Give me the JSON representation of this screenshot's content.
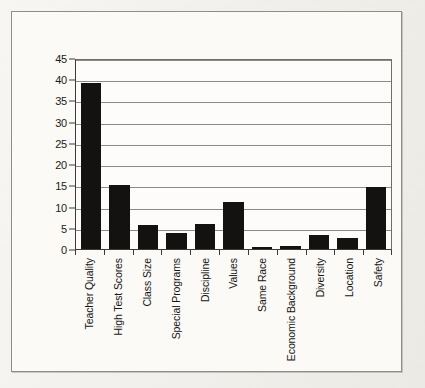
{
  "chart_data": {
    "type": "bar",
    "title": "",
    "xlabel": "",
    "ylabel": "% Mentioning Item",
    "ylim": [
      0,
      45
    ],
    "ytick_step": 5,
    "grid": true,
    "legend": "none",
    "orientation": "vertical",
    "bar_color": "#131211",
    "categories": [
      "Teacher Quality",
      "High Test Scores",
      "Class Size",
      "Special Programs",
      "Discipline",
      "Values",
      "Same Race",
      "Economic Background",
      "Diversity",
      "Location",
      "Safety"
    ],
    "values": [
      39,
      15,
      5.7,
      3.8,
      6,
      11,
      0.5,
      0.7,
      3.4,
      2.6,
      14.5
    ],
    "yticks": [
      0,
      5,
      10,
      15,
      20,
      25,
      30,
      35,
      40,
      45
    ],
    "ytick_labels": [
      "0",
      "5",
      "10",
      "15",
      "20",
      "25",
      "30",
      "35",
      "40",
      "45"
    ]
  },
  "figure": {
    "frame_color": "#8d8d8a",
    "background": "#fbfaf7",
    "axis_color": "#3a3a38",
    "grid_color": "#8a8a88"
  }
}
